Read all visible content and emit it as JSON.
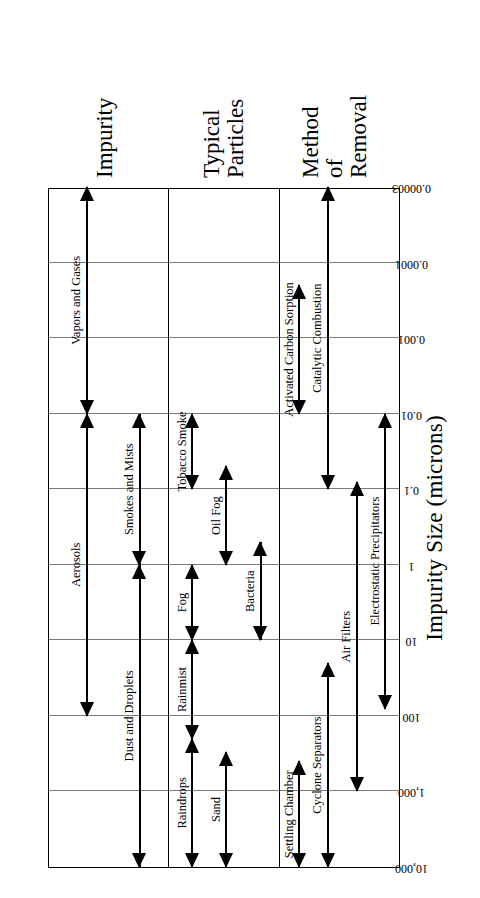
{
  "chart_data": {
    "type": "table",
    "title": "",
    "xlabel": "Impurity Size (microns)",
    "ylabel": "",
    "scale": "log-reversed",
    "grid": true,
    "legend_position": "none",
    "tick_labels": [
      "10,000",
      "1,000",
      "100",
      "10",
      "1",
      "0.1",
      "0.01",
      "0.001",
      "0.0001",
      "0.00003"
    ],
    "tick_values": [
      10000,
      1000,
      100,
      10,
      1,
      0.1,
      0.01,
      0.001,
      0.0001,
      3e-05
    ],
    "row_labels": [
      "Impurity",
      "Typical Particles",
      "Method\nof\nRemoval"
    ],
    "series": [
      {
        "name": "Impurity",
        "values": [
          {
            "label": "Vapors and Gases",
            "from": 0.01,
            "to": 3e-05,
            "lane": 0,
            "both_heads": true
          },
          {
            "label": "Aerosols",
            "from": 100,
            "to": 0.01,
            "lane": 0,
            "both_heads": true
          },
          {
            "label": "Smokes and Mists",
            "from": 1,
            "to": 0.01,
            "lane": 1,
            "both_heads": true
          },
          {
            "label": "Dust and Droplets",
            "from": 10000,
            "to": 1,
            "lane": 1,
            "both_heads": true
          }
        ]
      },
      {
        "name": "Typical Particles",
        "values": [
          {
            "label": "Tobacco Smoke",
            "from": 0.1,
            "to": 0.01,
            "lane": 0,
            "both_heads": true
          },
          {
            "label": "Oil Fog",
            "from": 1,
            "to": 0.05,
            "lane": 1,
            "both_heads": true
          },
          {
            "label": "Bacteria",
            "from": 10,
            "to": 0.5,
            "lane": 2,
            "both_heads": true
          },
          {
            "label": "Fog",
            "from": 10,
            "to": 1,
            "lane": 0,
            "both_heads": true
          },
          {
            "label": "Rainmist",
            "from": 200,
            "to": 10,
            "lane": 0,
            "both_heads": true
          },
          {
            "label": "Raindrops",
            "from": 10000,
            "to": 200,
            "lane": 0,
            "both_heads": true
          },
          {
            "label": "Sand",
            "from": 10000,
            "to": 300,
            "lane": 1,
            "both_heads": true
          }
        ]
      },
      {
        "name": "Method of Removal",
        "values": [
          {
            "label": "Activated Carbon Sorption",
            "from": 0.01,
            "to": 0.0002,
            "lane": 0,
            "both_heads": true
          },
          {
            "label": "Catalytic Combustion",
            "from": 0.1,
            "to": 3e-05,
            "lane": 1,
            "both_heads": true
          },
          {
            "label": "Settling Chamber",
            "from": 10000,
            "to": 400,
            "lane": 0,
            "both_heads": true
          },
          {
            "label": "Cyclone Separators",
            "from": 10000,
            "to": 20,
            "lane": 1,
            "both_heads": true
          },
          {
            "label": "Air Filters",
            "from": 1000,
            "to": 0.08,
            "lane": 2,
            "both_heads": true
          },
          {
            "label": "Electrostatic Precipitators",
            "from": 80,
            "to": 0.01,
            "lane": 3,
            "both_heads": true
          }
        ]
      }
    ]
  },
  "axis": {
    "title": "Impurity Size (microns)"
  },
  "rows": {
    "impurity": "Impurity",
    "typical_particles_line1": "Typical",
    "typical_particles_line2": "Particles",
    "method_line1": "Method",
    "method_line2": "of",
    "method_line3": "Removal"
  },
  "colors": {
    "ink": "#000000",
    "grid": "#7a7a7a",
    "background": "#ffffff"
  }
}
